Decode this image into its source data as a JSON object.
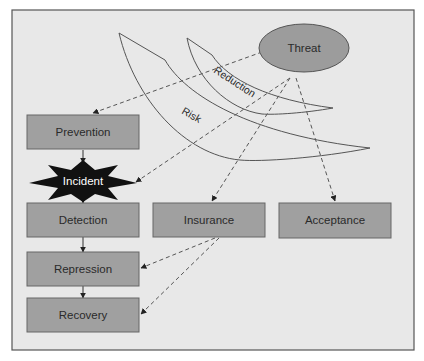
{
  "diagram": {
    "title": "",
    "colors": {
      "background": "#e8e8e8",
      "frame": "#555555",
      "box_fill": "#a0a0a0",
      "box_stroke": "#666666",
      "threat_fill": "#9c9c9c",
      "incident_fill": "#111111",
      "line": "#555555"
    },
    "nodes": {
      "threat": "Threat",
      "prevention": "Prevention",
      "incident": "Incident",
      "detection": "Detection",
      "insurance": "Insurance",
      "acceptance": "Acceptance",
      "repression": "Repression",
      "recovery": "Recovery"
    },
    "bands": {
      "reduction": "Reduction",
      "risk": "Risk"
    },
    "edges": [
      {
        "from": "Threat",
        "to": "Prevention",
        "style": "dashed"
      },
      {
        "from": "Threat",
        "to": "Incident",
        "style": "dashed"
      },
      {
        "from": "Threat",
        "to": "Insurance",
        "style": "dashed"
      },
      {
        "from": "Threat",
        "to": "Acceptance",
        "style": "dashed"
      },
      {
        "from": "Insurance",
        "to": "Repression",
        "style": "dashed"
      },
      {
        "from": "Insurance",
        "to": "Recovery",
        "style": "dashed"
      },
      {
        "from": "Prevention",
        "to": "Incident",
        "style": "solid"
      },
      {
        "from": "Incident",
        "to": "Detection",
        "style": "solid"
      },
      {
        "from": "Detection",
        "to": "Repression",
        "style": "solid"
      },
      {
        "from": "Repression",
        "to": "Recovery",
        "style": "solid"
      }
    ]
  }
}
